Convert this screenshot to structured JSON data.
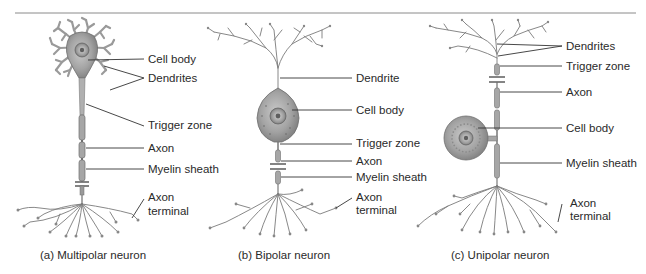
{
  "figure": {
    "panels": [
      {
        "id": "a",
        "caption": "(a) Multipolar neuron",
        "labels": {
          "cell_body": "Cell body",
          "dendrites": "Dendrites",
          "trigger_zone": "Trigger zone",
          "axon": "Axon",
          "myelin_sheath": "Myelin sheath",
          "axon_terminal_1": "Axon",
          "axon_terminal_2": "terminal"
        }
      },
      {
        "id": "b",
        "caption": "(b) Bipolar neuron",
        "labels": {
          "dendrite": "Dendrite",
          "cell_body": "Cell body",
          "trigger_zone": "Trigger zone",
          "axon": "Axon",
          "myelin_sheath": "Myelin sheath",
          "axon_terminal_1": "Axon",
          "axon_terminal_2": "terminal"
        }
      },
      {
        "id": "c",
        "caption": "(c) Unipolar neuron",
        "labels": {
          "dendrites": "Dendrites",
          "trigger_zone": "Trigger zone",
          "axon": "Axon",
          "cell_body": "Cell body",
          "myelin_sheath": "Myelin sheath",
          "axon_terminal_1": "Axon",
          "axon_terminal_2": "terminal"
        }
      }
    ],
    "colors": {
      "rule": "#8a8a8a",
      "leader": "#333333",
      "neuron_fill": "#bdbdbd",
      "neuron_stroke": "#6e6e6e",
      "soma_fill": "#9c9c9c",
      "nucleus": "#7a7a7a",
      "text": "#2a2a2a"
    }
  }
}
